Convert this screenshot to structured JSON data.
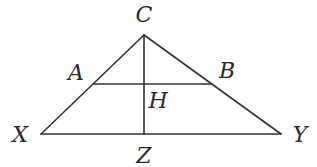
{
  "diagram": {
    "type": "geometry-triangle",
    "colors": {
      "line": "#333333",
      "label": "#2a2a2a",
      "background": "#ffffff"
    },
    "points": {
      "C": {
        "label": "C",
        "x": 144,
        "y": 35,
        "lx": 144,
        "ly": 22
      },
      "X": {
        "label": "X",
        "x": 41,
        "y": 134,
        "lx": 20,
        "ly": 142
      },
      "Y": {
        "label": "Y",
        "x": 281,
        "y": 134,
        "lx": 300,
        "ly": 142
      },
      "Z": {
        "label": "Z",
        "x": 144,
        "y": 134,
        "lx": 144,
        "ly": 163
      },
      "A": {
        "label": "A",
        "x": 93,
        "y": 84,
        "lx": 76,
        "ly": 80
      },
      "B": {
        "label": "B",
        "x": 212,
        "y": 84,
        "lx": 227,
        "ly": 78
      },
      "H": {
        "label": "H",
        "x": 144,
        "y": 84,
        "lx": 158,
        "ly": 108
      }
    },
    "segments": [
      "XC",
      "CY",
      "XY",
      "AB",
      "CZ"
    ]
  }
}
